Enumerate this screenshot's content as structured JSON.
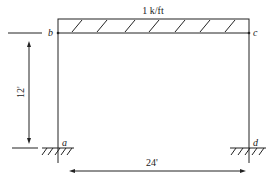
{
  "diagram": {
    "type": "structural-frame",
    "load": {
      "label": "1 k/ft",
      "type": "uniform-distributed"
    },
    "nodes": [
      {
        "id": "a",
        "label": "a",
        "support": "fixed"
      },
      {
        "id": "b",
        "label": "b"
      },
      {
        "id": "c",
        "label": "c"
      },
      {
        "id": "d",
        "label": "d",
        "support": "fixed"
      }
    ],
    "dimensions": {
      "height": "12'",
      "width": "24'"
    }
  }
}
